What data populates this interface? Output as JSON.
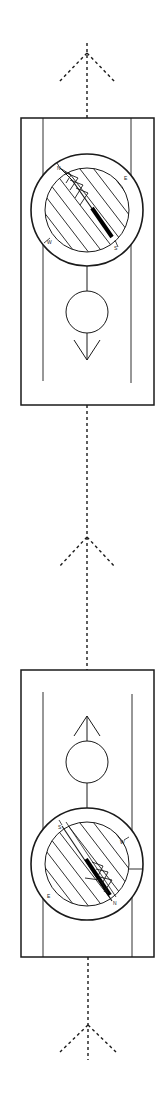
{
  "diagram": {
    "colors": {
      "ink": "#1a1a1a",
      "background": "#ffffff"
    },
    "arrows": [
      {
        "id": "top-direction-arrow",
        "direction": "up"
      },
      {
        "id": "middle-direction-arrow",
        "direction": "up"
      },
      {
        "id": "bottom-direction-arrow",
        "direction": "up"
      }
    ],
    "compasses": [
      {
        "id": "compass-forward",
        "direction_of_travel_arrow": "down",
        "needle_points": "north-west (top-left)",
        "bezel_labels": [
          "N",
          "E",
          "S",
          "W"
        ]
      },
      {
        "id": "compass-reverse",
        "direction_of_travel_arrow": "up",
        "needle_points": "south-east (bottom-right)",
        "bezel_labels": [
          "N",
          "E",
          "S",
          "W"
        ]
      }
    ]
  }
}
